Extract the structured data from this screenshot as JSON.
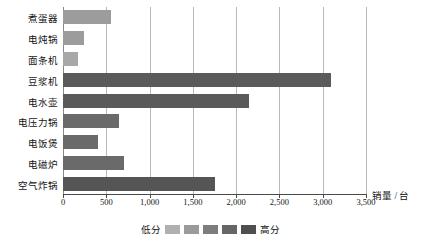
{
  "chart_data": {
    "type": "bar",
    "orientation": "horizontal",
    "title": "",
    "xlabel": "销量 / 台",
    "ylabel": "",
    "xlim": [
      0,
      3500
    ],
    "xticks": [
      0,
      500,
      1000,
      1500,
      2000,
      2500,
      3000,
      3500
    ],
    "xticklabels": [
      "0",
      "500",
      "1,000",
      "1,500",
      "2,000",
      "2,500",
      "3,000",
      "3,500"
    ],
    "grid": true,
    "categories": [
      "煮蛋器",
      "电炖锅",
      "面条机",
      "豆浆机",
      "电水壶",
      "电压力锅",
      "电饭煲",
      "电磁炉",
      "空气炸锅"
    ],
    "values": [
      560,
      240,
      175,
      3100,
      2150,
      650,
      410,
      710,
      1760
    ],
    "bar_colors": [
      "#9c9c9c",
      "#9c9c9c",
      "#a8a8a8",
      "#5a5a5a",
      "#5a5a5a",
      "#6a6a6a",
      "#6a6a6a",
      "#6a6a6a",
      "#555555"
    ],
    "legend": {
      "position": "bottom",
      "low_label": "低分",
      "high_label": "高分",
      "swatches": [
        "#b0b0b0",
        "#9a9a9a",
        "#7d7d7d",
        "#666666",
        "#4f4f4f"
      ]
    },
    "axis_color": "#4a4a4a",
    "grid_color": "#b9b9b9"
  }
}
